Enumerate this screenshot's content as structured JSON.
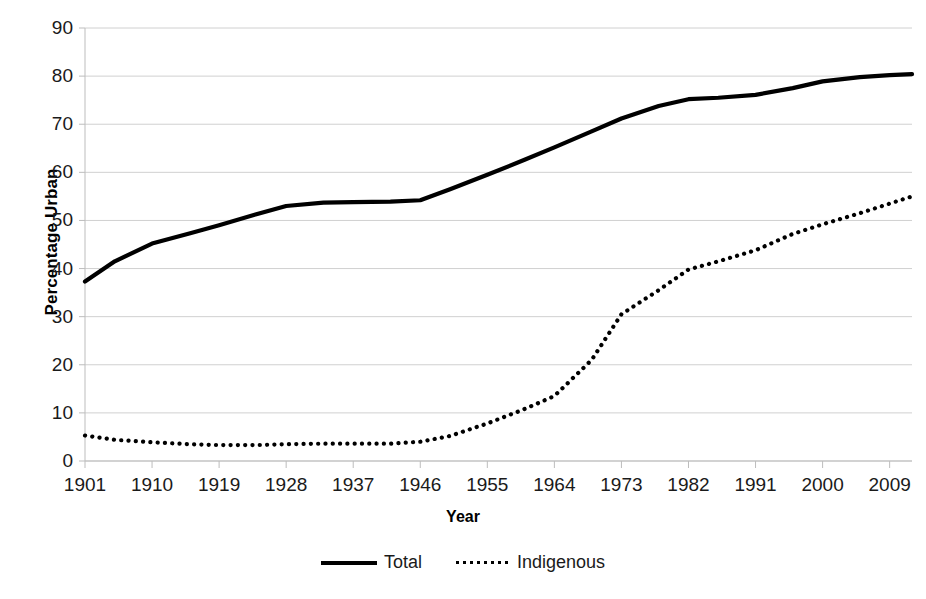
{
  "chart_data": {
    "type": "line",
    "title": "",
    "xlabel": "Year",
    "ylabel": "Percentage Urban",
    "xlim": [
      1901,
      2012
    ],
    "ylim": [
      0,
      90
    ],
    "ytick_step": 10,
    "grid": "horizontal",
    "legend_position": "bottom",
    "yticks": [
      90,
      80,
      70,
      60,
      50,
      40,
      30,
      20,
      10,
      0
    ],
    "xticks": [
      1901,
      1910,
      1919,
      1928,
      1937,
      1946,
      1955,
      1964,
      1973,
      1982,
      1991,
      2000,
      2009
    ],
    "x": [
      1901,
      1905,
      1910,
      1915,
      1919,
      1924,
      1928,
      1933,
      1937,
      1942,
      1946,
      1950,
      1955,
      1960,
      1964,
      1969,
      1973,
      1978,
      1982,
      1986,
      1991,
      1996,
      2000,
      2005,
      2009,
      2012
    ],
    "series": [
      {
        "name": "Total",
        "style": "solid",
        "color": "#000000",
        "values": [
          37.3,
          41.5,
          45.2,
          47.3,
          49.0,
          51.3,
          53.0,
          53.7,
          53.8,
          53.9,
          54.2,
          56.5,
          59.5,
          62.6,
          65.2,
          68.5,
          71.2,
          73.8,
          75.2,
          75.5,
          76.1,
          77.5,
          78.9,
          79.8,
          80.2,
          80.4
        ]
      },
      {
        "name": "Indigenous",
        "style": "dotted",
        "color": "#000000",
        "values": [
          5.3,
          4.4,
          3.9,
          3.5,
          3.3,
          3.3,
          3.5,
          3.6,
          3.6,
          3.6,
          4.0,
          5.2,
          7.8,
          10.8,
          13.5,
          21.0,
          30.5,
          35.5,
          39.8,
          41.5,
          43.8,
          47.2,
          49.2,
          51.5,
          53.5,
          55.0
        ]
      }
    ],
    "legend": [
      {
        "label": "Total",
        "style": "solid"
      },
      {
        "label": "Indigenous",
        "style": "dotted"
      }
    ],
    "colors": {
      "grid": "#d0d0d0",
      "axis": "#bdbdbd",
      "text": "#1a1a1a",
      "background": "#ffffff"
    }
  }
}
